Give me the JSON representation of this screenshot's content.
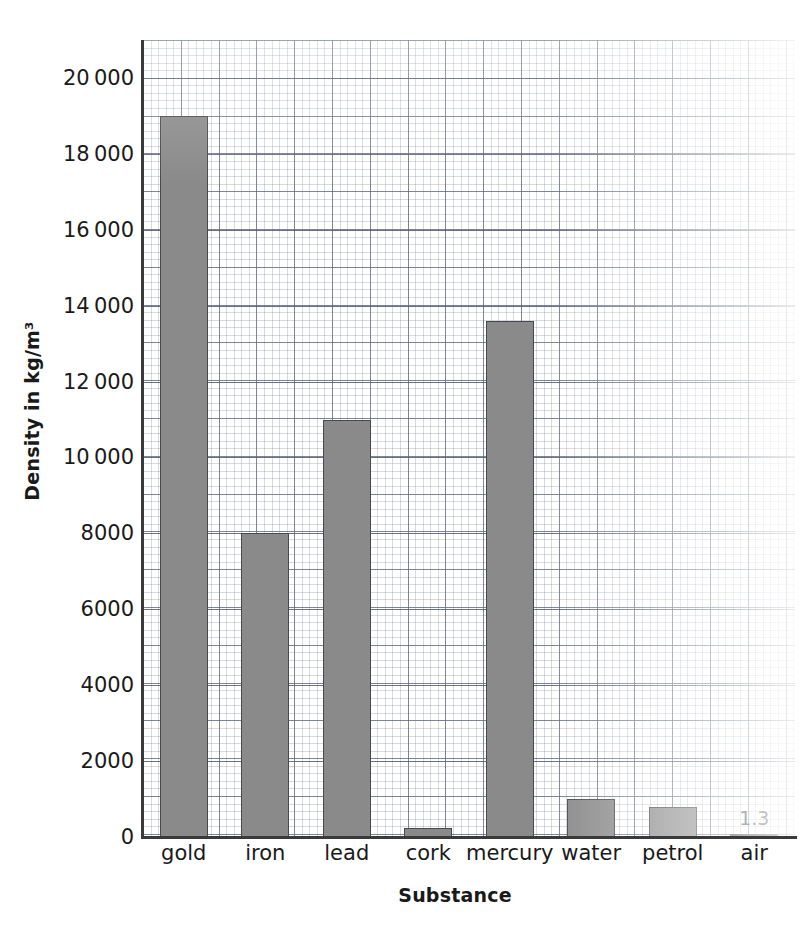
{
  "chart_data": {
    "type": "bar",
    "title": "",
    "xlabel": "Substance",
    "ylabel": "Density in kg/m³",
    "categories": [
      "gold",
      "iron",
      "lead",
      "cork",
      "mercury",
      "water",
      "petrol",
      "air"
    ],
    "values": [
      19000,
      8000,
      11000,
      250,
      13600,
      1000,
      800,
      1.3
    ],
    "point_labels": [
      "",
      "",
      "",
      "",
      "",
      "",
      "",
      "1.3"
    ],
    "ylim": [
      0,
      21000
    ],
    "y_ticks": [
      0,
      2000,
      4000,
      6000,
      8000,
      10000,
      12000,
      14000,
      16000,
      18000,
      20000
    ],
    "y_tick_labels": [
      "0",
      "2000",
      "4000",
      "6000",
      "8000",
      "10 000",
      "12 000",
      "14 000",
      "16 000",
      "18 000",
      "20 000"
    ],
    "grid": true,
    "grid_style": "graph-paper (fine dotted minor, solid major)",
    "legend": false,
    "series_name": "Density",
    "bar_color": "#8a8a8a",
    "bar_edge_color": "#4a4a4a",
    "axis_color": "#3a3a3a",
    "grid_color": "#7a869b",
    "background": "#ffffff"
  }
}
